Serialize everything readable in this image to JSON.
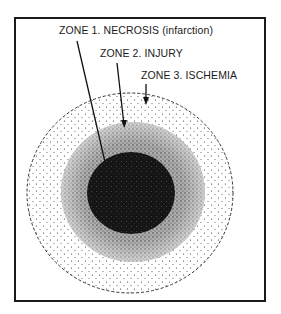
{
  "diagram": {
    "type": "concentric-zones",
    "zones": [
      {
        "id": 1,
        "label": "ZONE 1.  NECROSIS (infarction)",
        "shade": "dark",
        "color": "#1c1c1c"
      },
      {
        "id": 2,
        "label": "ZONE 2.  INJURY",
        "shade": "medium",
        "color": "#8a8a8a"
      },
      {
        "id": 3,
        "label": "ZONE 3.  ISCHEMIA",
        "shade": "light",
        "color": "#e4e4e4"
      }
    ],
    "colors": {
      "frame": "#1a1a1a",
      "background": "#ffffff",
      "ink": "#1a1a1a"
    }
  }
}
